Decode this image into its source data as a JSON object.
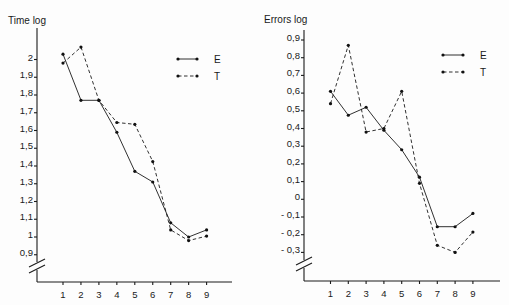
{
  "chart_data": [
    {
      "type": "line",
      "title": "Time log",
      "xlabel": "",
      "ylabel": "Time log",
      "x": [
        1,
        2,
        3,
        4,
        5,
        6,
        7,
        8,
        9
      ],
      "y_ticks": [
        "2",
        "1,9",
        "1,8",
        "1,7",
        "1,6",
        "1,5",
        "1,4",
        "1,3",
        "1,2",
        "1,1",
        "1",
        "0,9"
      ],
      "y_tick_values": [
        2.0,
        1.9,
        1.8,
        1.7,
        1.6,
        1.5,
        1.4,
        1.3,
        1.2,
        1.1,
        1.0,
        0.9
      ],
      "ylim": [
        0.9,
        2.0
      ],
      "axis_break": true,
      "grid": false,
      "legend_position": "upper right",
      "series": [
        {
          "name": "E",
          "style": "solid",
          "values": [
            2.03,
            1.77,
            1.77,
            1.59,
            1.37,
            1.31,
            1.08,
            1.0,
            1.04
          ]
        },
        {
          "name": "T",
          "style": "dashed",
          "values": [
            1.98,
            2.07,
            1.77,
            1.645,
            1.635,
            1.425,
            1.04,
            0.98,
            1.005
          ]
        }
      ]
    },
    {
      "type": "line",
      "title": "Errors log",
      "xlabel": "",
      "ylabel": "Errors log",
      "x": [
        1,
        2,
        3,
        4,
        5,
        6,
        7,
        8,
        9
      ],
      "y_ticks": [
        "0,9",
        "0,8",
        "0,7",
        "0,6",
        "0,5",
        "0,4",
        "0,3",
        "0,2",
        "0,1",
        "0",
        "- 0,1",
        "- 0,2",
        "- 0,3"
      ],
      "y_tick_values": [
        0.9,
        0.8,
        0.7,
        0.6,
        0.5,
        0.4,
        0.3,
        0.2,
        0.1,
        0.0,
        -0.1,
        -0.2,
        -0.3
      ],
      "ylim": [
        -0.3,
        0.9
      ],
      "axis_break": true,
      "grid": false,
      "legend_position": "upper right",
      "series": [
        {
          "name": "E",
          "style": "solid",
          "values": [
            0.61,
            0.475,
            0.52,
            0.39,
            0.28,
            0.125,
            -0.155,
            -0.155,
            -0.08
          ]
        },
        {
          "name": "T",
          "style": "dashed",
          "values": [
            0.54,
            0.87,
            0.38,
            0.4,
            0.61,
            0.09,
            -0.26,
            -0.3,
            -0.185
          ]
        }
      ]
    }
  ],
  "layout": [
    {
      "title_pos": [
        8,
        24
      ],
      "y_axis_x": 37,
      "y_axis_top": 28,
      "x_axis_y": 282,
      "x_axis_right": 232,
      "x_first_px": 63,
      "x_step_px": 17.95,
      "y_ref_value": 2.0,
      "y_ref_px": 59.5,
      "px_per_unit": 177.5,
      "legend": {
        "x1": 178,
        "x2": 197,
        "label_x": 214,
        "yE": 59,
        "yT": 76
      },
      "break_y": 265
    },
    {
      "title_pos": [
        264,
        23
      ],
      "y_axis_x": 304,
      "y_axis_top": 30,
      "x_axis_y": 281,
      "x_axis_right": 500,
      "x_first_px": 330.5,
      "x_step_px": 17.8,
      "y_ref_value": 0.0,
      "y_ref_px": 199.3,
      "px_per_unit": 177.0,
      "legend": {
        "x1": 443,
        "x2": 463,
        "label_x": 480,
        "yE": 55,
        "yT": 72
      },
      "break_y": 263
    }
  ]
}
